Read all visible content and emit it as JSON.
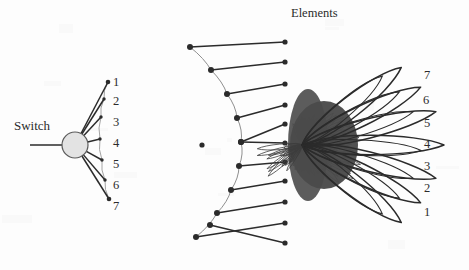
{
  "figure": {
    "title_label": "Elements",
    "switch_label": "Switch",
    "background_color": "#fdfdfd",
    "ink_color": "#2b2b2b",
    "switch_fill_color": "#e3e3e3",
    "beam_fill_color": "#4a4a4a"
  },
  "switch": {
    "label": "Switch",
    "center_x": 75,
    "center_y": 145,
    "radius": 13,
    "input_line_from_x": 30,
    "port_labels": [
      "1",
      "2",
      "3",
      "4",
      "5",
      "6",
      "7"
    ],
    "port_points": [
      {
        "n": "1",
        "x": 108,
        "y": 82
      },
      {
        "n": "2",
        "x": 104,
        "y": 99
      },
      {
        "n": "3",
        "x": 101,
        "y": 117
      },
      {
        "n": "4",
        "x": 100,
        "y": 139
      },
      {
        "n": "5",
        "x": 102,
        "y": 160
      },
      {
        "n": "6",
        "x": 105,
        "y": 180
      },
      {
        "n": "7",
        "x": 109,
        "y": 199
      }
    ],
    "label_x": 113,
    "label_ys": [
      82,
      101,
      122,
      143,
      164,
      185,
      206
    ]
  },
  "array": {
    "label": "Elements",
    "label_x": 291,
    "label_y": 14,
    "focus_point": {
      "x": 202,
      "y": 145,
      "r": 2.6
    },
    "reflector_dots": [
      {
        "x": 190,
        "y": 47
      },
      {
        "x": 211,
        "y": 70
      },
      {
        "x": 227,
        "y": 94
      },
      {
        "x": 237,
        "y": 118
      },
      {
        "x": 241,
        "y": 142
      },
      {
        "x": 239,
        "y": 166
      },
      {
        "x": 231,
        "y": 190
      },
      {
        "x": 217,
        "y": 213
      },
      {
        "x": 196,
        "y": 237
      }
    ],
    "element_dots": [
      {
        "x": 285,
        "y": 42
      },
      {
        "x": 285,
        "y": 62
      },
      {
        "x": 285,
        "y": 84
      },
      {
        "x": 285,
        "y": 105
      },
      {
        "x": 285,
        "y": 124
      },
      {
        "x": 285,
        "y": 143
      },
      {
        "x": 285,
        "y": 162
      },
      {
        "x": 285,
        "y": 181
      },
      {
        "x": 285,
        "y": 202
      },
      {
        "x": 285,
        "y": 223
      },
      {
        "x": 285,
        "y": 243
      }
    ],
    "element_count": 11,
    "reflector_count": 9
  },
  "beams": {
    "origin": {
      "x": 302,
      "y": 145
    },
    "labels": [
      "7",
      "6",
      "5",
      "4",
      "3",
      "2",
      "1"
    ],
    "lobes": [
      {
        "n": "7",
        "angle_deg": -38,
        "length": 126,
        "width": 26,
        "label_x": 424,
        "label_y": 76
      },
      {
        "n": "6",
        "angle_deg": -26,
        "length": 132,
        "width": 25,
        "label_x": 423,
        "label_y": 101
      },
      {
        "n": "5",
        "angle_deg": -14,
        "length": 138,
        "width": 24,
        "label_x": 424,
        "label_y": 124
      },
      {
        "n": "4",
        "angle_deg": 0,
        "length": 142,
        "width": 24,
        "label_x": 424,
        "label_y": 145
      },
      {
        "n": "3",
        "angle_deg": 14,
        "length": 138,
        "width": 24,
        "label_x": 424,
        "label_y": 167
      },
      {
        "n": "2",
        "angle_deg": 26,
        "length": 132,
        "width": 25,
        "label_x": 424,
        "label_y": 189
      },
      {
        "n": "1",
        "angle_deg": 38,
        "length": 126,
        "width": 26,
        "label_x": 424,
        "label_y": 213
      }
    ],
    "sidelobe_count": 7
  }
}
